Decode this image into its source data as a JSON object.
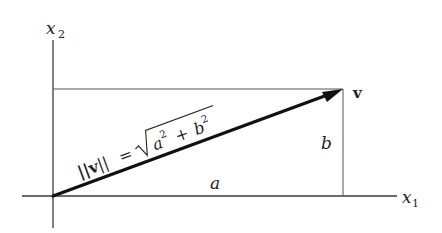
{
  "diagram": {
    "axes": {
      "x_label": "x",
      "x_sub": "1",
      "y_label": "x",
      "y_sub": "2"
    },
    "vector_label": "v",
    "side_a": "a",
    "side_b": "b",
    "formula": {
      "lhs": "||v||",
      "eq": "=",
      "rhs_a": "a",
      "rhs_a_exp": "2",
      "plus": "+",
      "rhs_b": "b",
      "rhs_b_exp": "2"
    },
    "colors": {
      "line": "#3a3a3a",
      "vector": "#111111",
      "background": "#ffffff"
    }
  }
}
